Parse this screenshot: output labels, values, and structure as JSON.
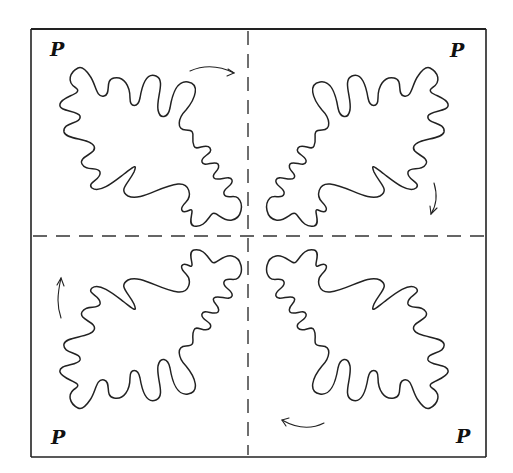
{
  "figure": {
    "quadrant_labels": {
      "top_left": "P",
      "top_right": "P",
      "bottom_left": "P",
      "bottom_right": "P"
    },
    "arrows": {
      "top_left": "clockwise arrow pointing right",
      "top_right": "arrow pointing down",
      "bottom_right": "arrow pointing left",
      "bottom_left": "arrow pointing up"
    },
    "colors": {
      "ink": "#222222",
      "background": "#ffffff"
    }
  }
}
